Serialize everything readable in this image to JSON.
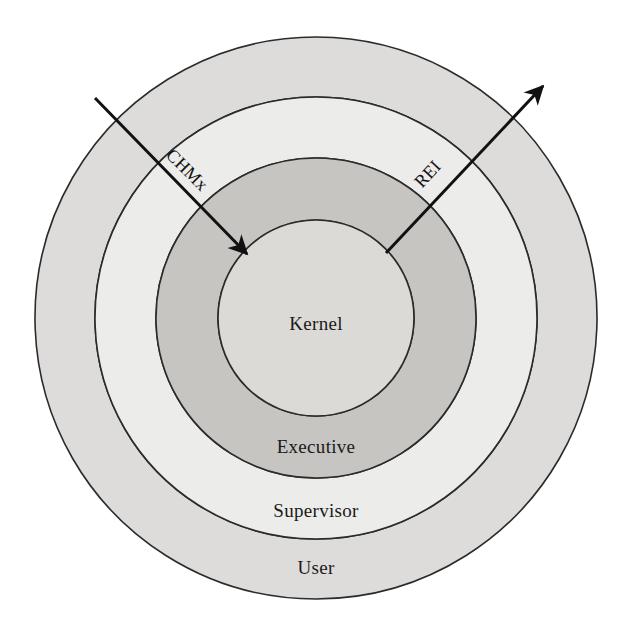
{
  "figure": {
    "type": "concentric-ring-diagram",
    "title": "",
    "background_color": "#ffffff"
  },
  "rings": [
    {
      "id": "user",
      "label": "User",
      "order": 4,
      "fill": "#dedcda",
      "outer_radius": 281,
      "inner_radius": 221,
      "label_x": 316,
      "label_y": 574
    },
    {
      "id": "supervisor",
      "label": "Supervisor",
      "order": 3,
      "fill": "#ececea",
      "outer_radius": 221,
      "inner_radius": 160,
      "label_x": 316,
      "label_y": 517
    },
    {
      "id": "executive",
      "label": "Executive",
      "order": 2,
      "fill": "#c6c5c2",
      "outer_radius": 160,
      "inner_radius": 98,
      "label_x": 316,
      "label_y": 453
    },
    {
      "id": "kernel",
      "label": "Kernel",
      "order": 1,
      "fill": "#dcdad7",
      "outer_radius": 98,
      "inner_radius": 0,
      "label_x": 316,
      "label_y": 330
    }
  ],
  "center": {
    "x": 316,
    "y": 318
  },
  "arrows": [
    {
      "id": "chmx",
      "label": "CHMx",
      "direction": "inward",
      "color": "#111111",
      "x1": 95,
      "y1": 98,
      "x2": 247,
      "y2": 254,
      "label_x": 183,
      "label_y": 174,
      "label_rotation": 45
    },
    {
      "id": "rei",
      "label": "REI",
      "direction": "outward",
      "color": "#111111",
      "x1": 386,
      "y1": 253,
      "x2": 543,
      "y2": 86,
      "label_x": 432,
      "label_y": 178,
      "label_rotation": -47
    }
  ],
  "outline_color": "#2b2b2b",
  "text_color": "#1a1a1a"
}
